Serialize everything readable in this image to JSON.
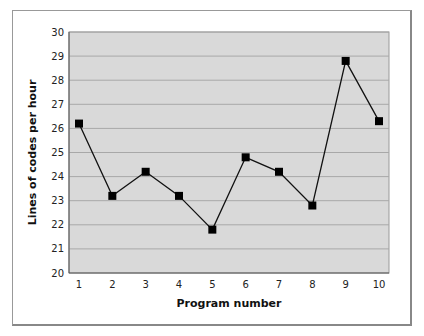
{
  "chart_data": {
    "type": "line",
    "title": "",
    "xlabel": "Program number",
    "ylabel": "Lines of codes per hour",
    "categories": [
      "1",
      "2",
      "3",
      "4",
      "5",
      "6",
      "7",
      "8",
      "9",
      "10"
    ],
    "x": [
      1,
      2,
      3,
      4,
      5,
      6,
      7,
      8,
      9,
      10
    ],
    "values": [
      26.2,
      23.2,
      24.2,
      23.2,
      21.8,
      24.8,
      24.2,
      22.8,
      28.8,
      26.3
    ],
    "ylim": [
      20,
      30
    ],
    "yticks": [
      20,
      21,
      22,
      23,
      24,
      25,
      26,
      27,
      28,
      29,
      30
    ],
    "grid": true,
    "legend": null,
    "colors": {
      "plot_bg": "#d9d9d9",
      "grid": "#a8a8a8",
      "line": "#111111",
      "marker": "#000000"
    }
  }
}
